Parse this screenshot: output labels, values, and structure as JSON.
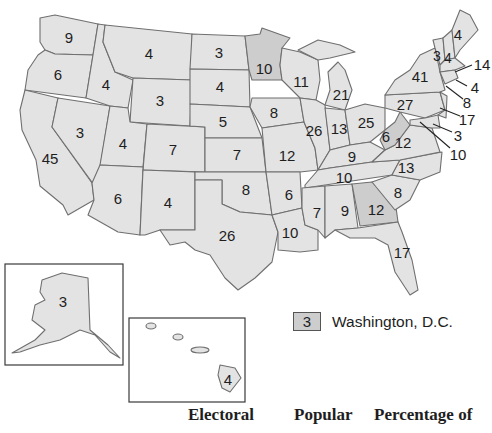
{
  "map": {
    "title": "Electoral votes by state",
    "colors": {
      "state_fill": "#e3e3e3",
      "highlight_fill": "#cdcdcd",
      "border": "#6f6f6f",
      "text": "#1e1e1e"
    },
    "states": {
      "WA": "9",
      "OR": "6",
      "CA": "45",
      "NV": "3",
      "ID": "4",
      "MT": "4",
      "WY": "3",
      "UT": "4",
      "AZ": "6",
      "CO": "7",
      "NM": "4",
      "ND": "3",
      "SD": "4",
      "NE": "5",
      "KS": "7",
      "OK": "8",
      "TX": "26",
      "MN": "10",
      "IA": "8",
      "MO": "12",
      "AR": "6",
      "LA": "10",
      "WI": "11",
      "IL": "26",
      "MI": "21",
      "IN": "13",
      "OH": "25",
      "KY": "9",
      "TN": "10",
      "MS": "7",
      "AL": "9",
      "GA": "12",
      "FL": "17",
      "SC": "8",
      "NC": "13",
      "VA": "12",
      "WV": "6",
      "PA": "27",
      "NY": "41",
      "VT": "3",
      "NH": "4",
      "ME": "4",
      "MA": "14",
      "RI": "4",
      "CT": "8",
      "NJ": "17",
      "DE": "3",
      "MD": "10",
      "AK": "3",
      "HI": "4"
    },
    "highlighted_states": [
      "MN",
      "WV",
      "GA"
    ]
  },
  "legend": {
    "dc_value": "3",
    "dc_label": "Washington, D.C."
  },
  "table_header": {
    "col1": "Electoral",
    "col2": "Popular",
    "col3": "Percentage of"
  }
}
